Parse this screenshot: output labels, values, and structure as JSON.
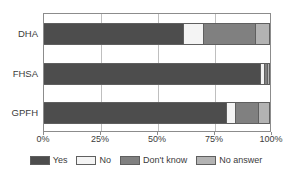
{
  "chart_data": {
    "type": "bar",
    "orientation": "horizontal",
    "stacked": true,
    "normalized": true,
    "title": "",
    "xlabel": "",
    "ylabel": "",
    "categories": [
      "DHA",
      "FHSA",
      "GPFH"
    ],
    "xlim": [
      0,
      100
    ],
    "xticks": [
      0,
      25,
      50,
      75,
      100
    ],
    "xtick_labels": [
      "0%",
      "25%",
      "50%",
      "75%",
      "100%"
    ],
    "grid": true,
    "legend_position": "bottom",
    "series": [
      {
        "name": "Yes",
        "color": "#4d4d4d",
        "values": [
          62,
          96,
          81
        ]
      },
      {
        "name": "No",
        "color": "#f4f4f4",
        "values": [
          9,
          2,
          4
        ]
      },
      {
        "name": "Don't know",
        "color": "#808080",
        "values": [
          23,
          1,
          10
        ]
      },
      {
        "name": "No answer",
        "color": "#b3b3b3",
        "values": [
          6,
          1,
          5
        ]
      }
    ]
  },
  "axis": {
    "tick_labels": [
      "0%",
      "25%",
      "50%",
      "75%",
      "100%"
    ],
    "category_labels": [
      "DHA",
      "FHSA",
      "GPFH"
    ]
  },
  "legend": {
    "items": [
      {
        "label": "Yes",
        "color": "#4d4d4d"
      },
      {
        "label": "No",
        "color": "#f4f4f4"
      },
      {
        "label": "Don't know",
        "color": "#808080"
      },
      {
        "label": "No answer",
        "color": "#b3b3b3"
      }
    ]
  },
  "colors": {
    "frame": "#8c8c8c",
    "grid": "#bfbfbf",
    "text": "#3b3b3b",
    "background": "#ffffff",
    "segment_border": "#5f5f5f"
  }
}
